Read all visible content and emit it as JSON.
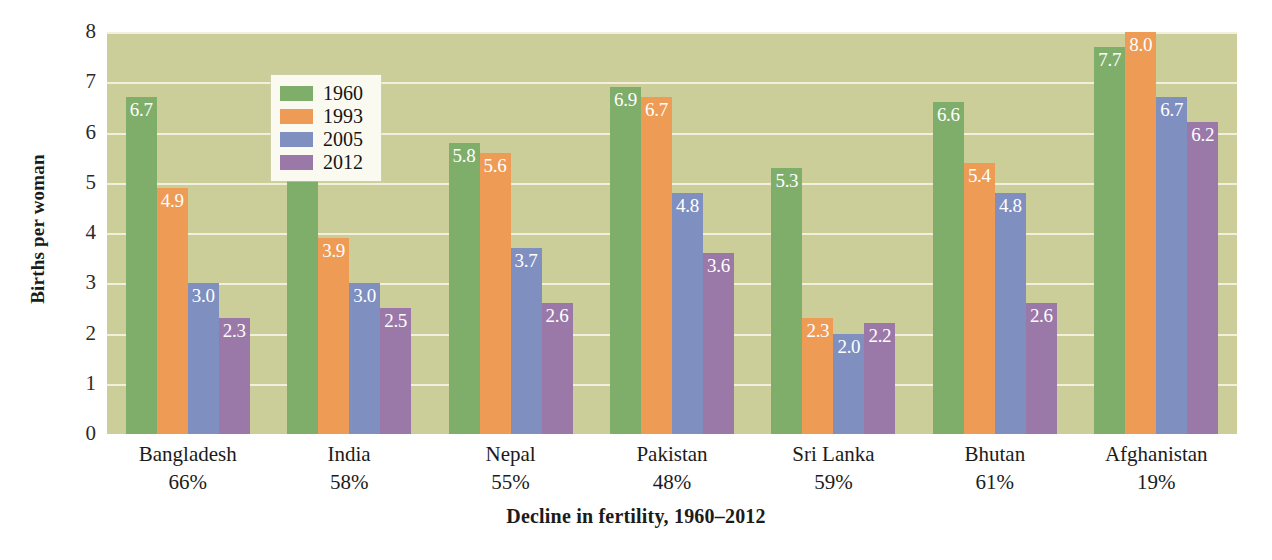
{
  "chart_data": {
    "type": "bar",
    "title": "",
    "xlabel": "Decline in fertility, 1960–2012",
    "ylabel": "Births per woman",
    "ylim": [
      0,
      8
    ],
    "ytick_labels": [
      "8",
      "7",
      "6",
      "5",
      "4",
      "3",
      "2",
      "1",
      "0"
    ],
    "ytick_values": [
      8,
      7,
      6,
      5,
      4,
      3,
      2,
      1,
      0
    ],
    "grid": true,
    "legend_position": "inside-top-left",
    "categories": [
      "Bangladesh",
      "India",
      "Nepal",
      "Pakistan",
      "Sri Lanka",
      "Bhutan",
      "Afghanistan"
    ],
    "category_sublabels": [
      "66%",
      "58%",
      "55%",
      "48%",
      "59%",
      "61%",
      "19%"
    ],
    "series": [
      {
        "name": "1960",
        "color": "#7fae6b",
        "values": [
          6.7,
          5.9,
          5.8,
          6.9,
          5.3,
          6.6,
          7.7
        ]
      },
      {
        "name": "1993",
        "color": "#ee9b55",
        "values": [
          4.9,
          3.9,
          5.6,
          6.7,
          2.3,
          5.4,
          8.0
        ]
      },
      {
        "name": "2005",
        "color": "#7e8fc0",
        "values": [
          3.0,
          3.0,
          3.7,
          4.8,
          2.0,
          4.8,
          6.7
        ]
      },
      {
        "name": "2012",
        "color": "#9a78a8",
        "values": [
          2.3,
          2.5,
          2.6,
          3.6,
          2.2,
          2.6,
          6.2
        ]
      }
    ],
    "value_labels": [
      [
        "6.7",
        "4.9",
        "3.0",
        "2.3"
      ],
      [
        "5.9",
        "3.9",
        "3.0",
        "2.5"
      ],
      [
        "5.8",
        "5.6",
        "3.7",
        "2.6"
      ],
      [
        "6.9",
        "6.7",
        "4.8",
        "3.6"
      ],
      [
        "5.3",
        "2.3",
        "2.0",
        "2.2"
      ],
      [
        "6.6",
        "5.4",
        "4.8",
        "2.6"
      ],
      [
        "7.7",
        "8.0",
        "6.7",
        "6.2"
      ]
    ],
    "plot_background_color": "#ccce9a",
    "gridline_color": "#f4f3e2",
    "page_background_color": "#ffffff",
    "legend_background_color": "#fbfaf1"
  },
  "legend": {
    "entries": [
      {
        "label": "1960",
        "color": "#7fae6b"
      },
      {
        "label": "1993",
        "color": "#ee9b55"
      },
      {
        "label": "2005",
        "color": "#7e8fc0"
      },
      {
        "label": "2012",
        "color": "#9a78a8"
      }
    ]
  }
}
